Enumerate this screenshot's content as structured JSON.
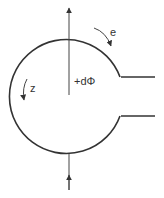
{
  "diagram": {
    "labels": {
      "flux": "+dΦ",
      "e": "e",
      "z": "z"
    },
    "colors": {
      "stroke": "#333333",
      "background": "#ffffff"
    },
    "elements": [
      "loop-with-gap",
      "output-leads",
      "flux-arrow-up",
      "incoming-arrow-bottom",
      "e-direction-arrow",
      "z-direction-arrow"
    ]
  }
}
